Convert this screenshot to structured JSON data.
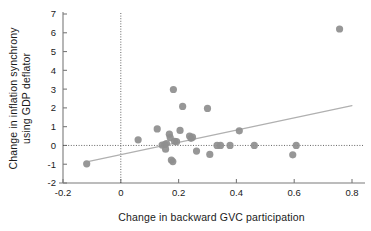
{
  "chart_data": {
    "type": "scatter",
    "title": "",
    "xlabel": "Change in backward GVC participation",
    "ylabel_line1": "Change in inflation synchrony",
    "ylabel_line2": "using GDP deflator",
    "ylabel": "Change in inflation synchrony using GDP deflator",
    "xlim": [
      -0.2,
      0.8
    ],
    "ylim": [
      -2,
      7
    ],
    "xticks": [
      -0.2,
      0,
      0.2,
      0.4,
      0.6,
      0.8
    ],
    "xticklabels": [
      "-0.2",
      "0",
      "0.2",
      "0.4",
      "0.6",
      "0.8"
    ],
    "yticks": [
      -2,
      -1,
      0,
      1,
      2,
      3,
      4,
      5,
      6,
      7
    ],
    "yticklabels": [
      "-2",
      "-1",
      "0",
      "1",
      "2",
      "3",
      "4",
      "5",
      "6",
      "7"
    ],
    "grid": false,
    "legend": "none",
    "reference_lines": [
      {
        "name": "horizontal-zero-line",
        "orientation": "horizontal",
        "value": 0,
        "style": "dotted"
      },
      {
        "name": "vertical-zero-line",
        "orientation": "vertical",
        "value": 0,
        "style": "dotted"
      }
    ],
    "trendline": {
      "name": "linear-fit-line",
      "x_start": -0.11,
      "y_start": -0.85,
      "x_end": 0.8,
      "y_end": 2.12,
      "color": "#b0b0b0"
    },
    "marker": {
      "shape": "circle",
      "color": "#8e8e8e",
      "radius_px": 3.6
    },
    "points": [
      {
        "x": -0.118,
        "y": -0.98
      },
      {
        "x": 0.06,
        "y": 0.3
      },
      {
        "x": 0.126,
        "y": 0.88
      },
      {
        "x": 0.143,
        "y": 0.02
      },
      {
        "x": 0.152,
        "y": 0.05
      },
      {
        "x": 0.155,
        "y": -0.2
      },
      {
        "x": 0.158,
        "y": 0.1
      },
      {
        "x": 0.168,
        "y": 0.6
      },
      {
        "x": 0.171,
        "y": 0.42
      },
      {
        "x": 0.175,
        "y": -0.78
      },
      {
        "x": 0.18,
        "y": -0.86
      },
      {
        "x": 0.182,
        "y": 2.98
      },
      {
        "x": 0.186,
        "y": 0.22
      },
      {
        "x": 0.193,
        "y": 0.2
      },
      {
        "x": 0.205,
        "y": 0.8
      },
      {
        "x": 0.214,
        "y": 2.08
      },
      {
        "x": 0.238,
        "y": 0.5
      },
      {
        "x": 0.243,
        "y": 0.38
      },
      {
        "x": 0.248,
        "y": 0.44
      },
      {
        "x": 0.262,
        "y": -0.3
      },
      {
        "x": 0.3,
        "y": 1.97
      },
      {
        "x": 0.308,
        "y": -0.48
      },
      {
        "x": 0.333,
        "y": 0.0
      },
      {
        "x": 0.345,
        "y": 0.0
      },
      {
        "x": 0.378,
        "y": 0.0
      },
      {
        "x": 0.41,
        "y": 0.78
      },
      {
        "x": 0.462,
        "y": 0.0
      },
      {
        "x": 0.595,
        "y": -0.5
      },
      {
        "x": 0.607,
        "y": 0.0
      },
      {
        "x": 0.757,
        "y": 6.2
      }
    ]
  }
}
